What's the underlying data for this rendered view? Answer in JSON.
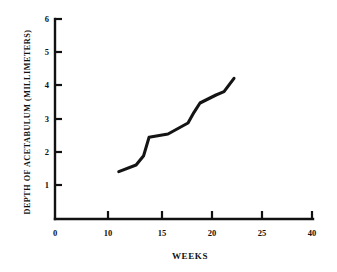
{
  "chart_data": {
    "type": "line",
    "title": "",
    "xlabel": "WEEKS",
    "ylabel": "DEPTH OF ACETABULUM (MILLIMETERS)",
    "xlim": [
      0,
      40
    ],
    "ylim": [
      0,
      6
    ],
    "grid": false,
    "legend": null,
    "x_ticks": [
      0,
      10,
      15,
      20,
      25,
      40
    ],
    "x_tick_labels": [
      "0",
      "10",
      "15",
      "20",
      "25",
      "40"
    ],
    "x_axis_note": "irregular spacing: 0 to 10 then 5-unit steps to 25, then compressed jump to 40",
    "y_ticks": [
      0,
      1,
      2,
      3,
      4,
      5,
      6
    ],
    "y_tick_labels": [
      "0",
      "1",
      "2",
      "3",
      "4",
      "5",
      "6"
    ],
    "series": [
      {
        "name": "Depth of acetabulum",
        "x": [
          11.0,
          12.6,
          13.3,
          13.8,
          15.6,
          17.6,
          18.2,
          18.8,
          20.4,
          21.2,
          22.2
        ],
        "y": [
          1.42,
          1.62,
          1.9,
          2.45,
          2.55,
          2.88,
          3.2,
          3.48,
          3.72,
          3.82,
          4.22
        ]
      }
    ]
  },
  "axes": {
    "y_axis_name": "y-axis",
    "x_axis_name": "x-axis"
  }
}
